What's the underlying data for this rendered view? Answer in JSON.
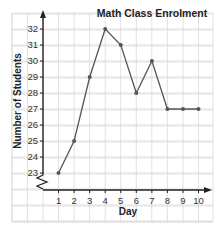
{
  "chart_data": {
    "type": "line",
    "title": "Math Class Enrolment",
    "xlabel": "Day",
    "ylabel": "Number of Students",
    "x": [
      1,
      2,
      3,
      4,
      5,
      6,
      7,
      8,
      9,
      10
    ],
    "categories": [
      "1",
      "2",
      "3",
      "4",
      "5",
      "6",
      "7",
      "8",
      "9",
      "10"
    ],
    "series": [
      {
        "name": "Enrolment",
        "values": [
          23,
          25,
          29,
          32,
          31,
          28,
          30,
          27,
          27,
          27
        ]
      }
    ],
    "yticks": [
      23,
      24,
      25,
      26,
      27,
      28,
      29,
      30,
      31,
      32
    ],
    "ylim": [
      23,
      32
    ],
    "y_axis_break": true,
    "grid": true,
    "legend": "none"
  },
  "colors": {
    "grid": "#d9d9d9",
    "axis": "#222222",
    "line": "#555555",
    "marker": "#555555"
  }
}
